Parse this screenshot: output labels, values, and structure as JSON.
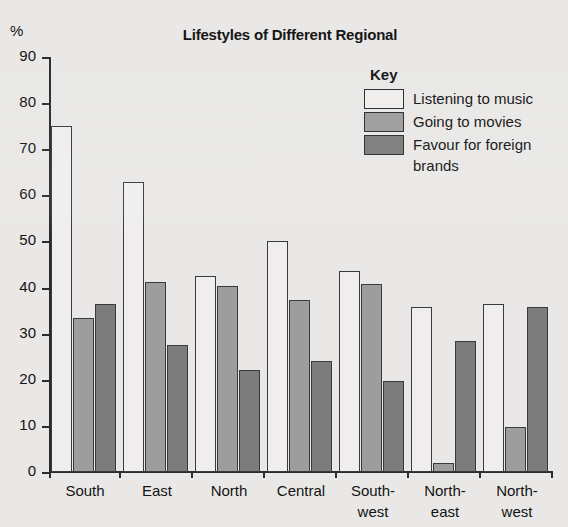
{
  "chart_data": {
    "type": "bar",
    "title": "Lifestyles of Different Regional",
    "xlabel": "",
    "ylabel": "%",
    "ylim": [
      0,
      90
    ],
    "yticks": [
      0,
      10,
      20,
      30,
      40,
      50,
      60,
      70,
      80,
      90
    ],
    "grid": false,
    "legend_position": "top-right",
    "legend_title": "Key",
    "categories": [
      "South",
      "East",
      "North",
      "Central",
      "South-west",
      "North-east",
      "North-west"
    ],
    "category_lines": [
      {
        "line1": "South",
        "line2": ""
      },
      {
        "line1": "East",
        "line2": ""
      },
      {
        "line1": "North",
        "line2": ""
      },
      {
        "line1": "Central",
        "line2": ""
      },
      {
        "line1": "South-",
        "line2": "west"
      },
      {
        "line1": "North-",
        "line2": "east"
      },
      {
        "line1": "North-",
        "line2": "west"
      }
    ],
    "series": [
      {
        "name": "Listening to music",
        "color": "#efeeec",
        "values": [
          75,
          63,
          42.5,
          50,
          43.5,
          35.8,
          36.5
        ]
      },
      {
        "name": "Going to movies",
        "color": "#9d9d9d",
        "values": [
          33.5,
          41.3,
          40.3,
          37.3,
          40.7,
          2,
          9.7
        ]
      },
      {
        "name": "Favour for foreign brands",
        "color": "#7c7c7c",
        "values": [
          36.5,
          27.5,
          22.2,
          24,
          19.8,
          28.5,
          35.8
        ]
      }
    ]
  },
  "legend": {
    "title": "Key",
    "entries": [
      {
        "label": "Listening to music"
      },
      {
        "label": "Going to movies"
      },
      {
        "label": "Favour for foreign brands"
      }
    ]
  },
  "axis": {
    "y_unit": "%"
  },
  "colors": {
    "background": "#e9e8e6",
    "axis": "#2b2b2b",
    "text": "#141414",
    "series_0": "#efeeec",
    "series_1": "#9d9d9d",
    "series_2": "#7c7c7c"
  }
}
